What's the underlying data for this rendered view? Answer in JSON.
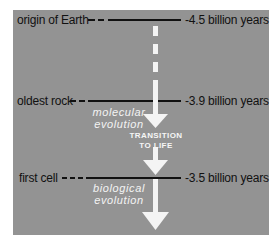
{
  "diagram": {
    "type": "timeline",
    "colors": {
      "panel": "#939393",
      "line": "#111111",
      "arrow": "#f4f4f4",
      "text_dark": "#111111",
      "text_light": "#f4f4f4"
    },
    "events": [
      {
        "label": "origin of Earth",
        "age": "-4.5 billion years"
      },
      {
        "label": "oldest rock",
        "age": "-3.9 billion years"
      },
      {
        "label": "first cell",
        "age": "-3.5 billion years"
      }
    ],
    "phases": [
      {
        "line1": "molecular",
        "line2": "evolution"
      },
      {
        "line1": "biological",
        "line2": "evolution"
      }
    ],
    "transition": {
      "line1": "TRANSITION",
      "line2": "TO LIFE"
    }
  }
}
